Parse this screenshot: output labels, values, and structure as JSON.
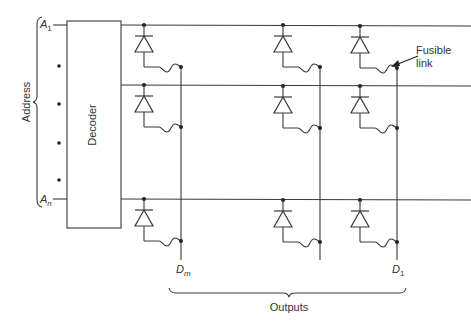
{
  "diagram": {
    "type": "diode ROM / fusible-link PROM",
    "decoder_label": "Decoder",
    "address_label": "Address",
    "address_inputs": [
      {
        "base": "A",
        "sub": "1"
      },
      {
        "base": "A",
        "sub": "n"
      }
    ],
    "outputs_label": "Outputs",
    "output_labels": [
      {
        "base": "D",
        "sub": "m"
      },
      {
        "base": "D",
        "sub": "1"
      }
    ],
    "annotation": {
      "line1": "Fusible",
      "line2": "link"
    },
    "colors": {
      "line": "#3a3a3a",
      "background": "#ffffff"
    }
  }
}
